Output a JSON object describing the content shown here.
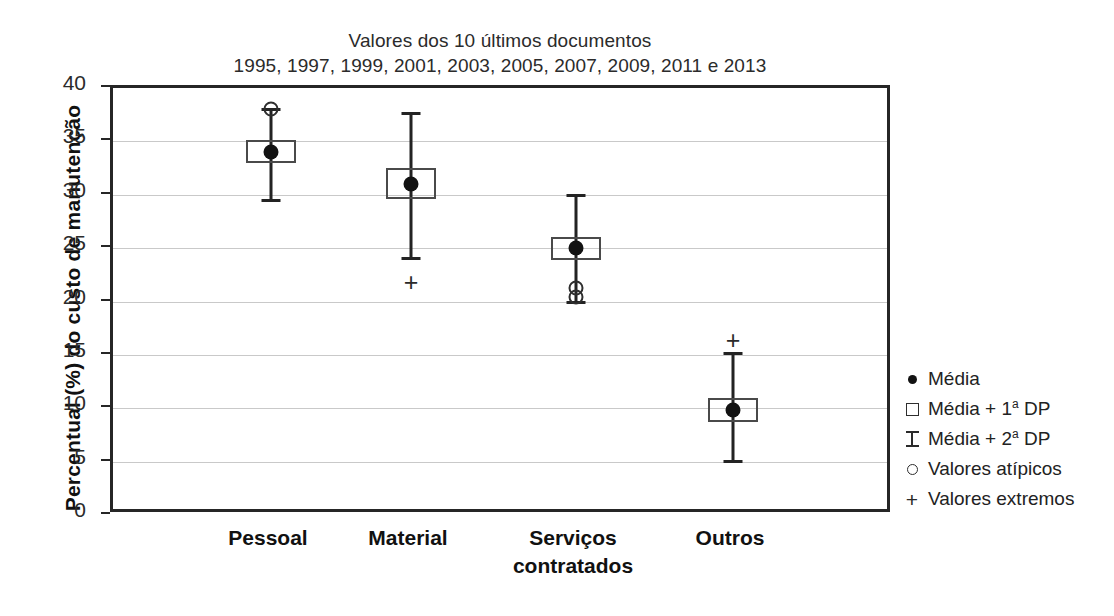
{
  "chart_data": {
    "type": "box",
    "title": "Valores dos 10 últimos documentos 1995, 1997, 1999, 2001, 2003, 2005, 2007, 2009, 2011 e 2013",
    "title_line1": "Valores dos 10 últimos documentos",
    "title_line2": "1995, 1997, 1999, 2001, 2003, 2005, 2007, 2009, 2011 e 2013",
    "xlabel": "",
    "ylabel": "Percentual (%) do custo de manutenção",
    "ylim": [
      0,
      40
    ],
    "ytick_labels": [
      "40",
      "35",
      "30",
      "25",
      "20",
      "15",
      "10",
      "5",
      "0"
    ],
    "yticks": [
      40,
      35,
      30,
      25,
      20,
      15,
      10,
      5,
      0
    ],
    "grid": true,
    "legend_position": "right",
    "categories": [
      "Pessoal",
      "Material",
      "Serviços contratados",
      "Outros"
    ],
    "series": [
      {
        "name": "Pessoal",
        "label_lines": [
          "Pessoal"
        ],
        "mean": 34.0,
        "box_low": 33.0,
        "box_high": 35.1,
        "whisker_low": 29.5,
        "whisker_high": 38.0,
        "outliers": [
          38.0
        ],
        "extremes": []
      },
      {
        "name": "Material",
        "label_lines": [
          "Material"
        ],
        "mean": 31.0,
        "box_low": 29.6,
        "box_high": 32.5,
        "whisker_low": 24.0,
        "whisker_high": 37.6,
        "outliers": [],
        "extremes": [
          21.8
        ]
      },
      {
        "name": "Serviços contratados",
        "label_lines": [
          "Serviços",
          "contratados"
        ],
        "mean": 25.0,
        "box_low": 23.9,
        "box_high": 26.0,
        "whisker_low": 19.9,
        "whisker_high": 29.9,
        "outliers": [
          21.3,
          20.4
        ],
        "extremes": []
      },
      {
        "name": "Outros",
        "label_lines": [
          "Outros"
        ],
        "mean": 9.8,
        "box_low": 8.7,
        "box_high": 11.0,
        "whisker_low": 5.0,
        "whisker_high": 15.1,
        "outliers": [],
        "extremes": [
          16.4
        ]
      }
    ],
    "legend": [
      {
        "marker": "mean-dot-icon",
        "label": "Média",
        "label_prefix": "Média",
        "label_sup": "",
        "label_suffix": ""
      },
      {
        "marker": "open-square-icon",
        "label": "Média + 1ª DP",
        "label_prefix": "Média + 1",
        "label_sup": "a",
        "label_suffix": " DP"
      },
      {
        "marker": "i-bar-icon",
        "label": "Média + 2ª DP",
        "label_prefix": "Média + 2",
        "label_sup": "a",
        "label_suffix": " DP"
      },
      {
        "marker": "open-circle-icon",
        "label": "Valores atípicos",
        "label_prefix": "Valores atípicos",
        "label_sup": "",
        "label_suffix": ""
      },
      {
        "marker": "plus-icon",
        "label": "Valores extremos",
        "label_prefix": "Valores extremos",
        "label_sup": "",
        "label_suffix": ""
      }
    ],
    "colors": {
      "axis": "#262626",
      "grid": "#c9c9c9",
      "marker": "#121212",
      "box_border": "#4a4a4a",
      "background": "#ffffff"
    }
  }
}
